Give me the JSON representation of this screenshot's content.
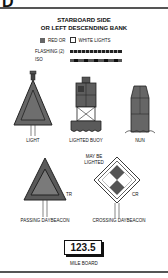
{
  "header": {
    "section_letter": "D"
  },
  "title": {
    "line1": "STARBOARD SIDE",
    "line2": "OR LEFT DESCENDING BANK"
  },
  "legend": {
    "red_label": "RED OR",
    "white_label": "WHITE LIGHTS",
    "flashing_label": "FLASHING (2)",
    "iso_label": "ISO",
    "colors": {
      "red_swatch": "#666666",
      "white_swatch": "#ffffff"
    }
  },
  "aids": [
    {
      "name": "LIGHT"
    },
    {
      "name": "LIGHTED BUOY"
    },
    {
      "name": "NUN"
    },
    {
      "name": "PASSING DAYBEACON",
      "code": "TR"
    },
    {
      "name": "CROSSING DAYBEACON",
      "code": "CR",
      "note_line1": "MAY BE",
      "note_line2": "LIGHTED"
    }
  ],
  "mile_board": {
    "value": "123.5",
    "label": "MILE BOARD"
  }
}
